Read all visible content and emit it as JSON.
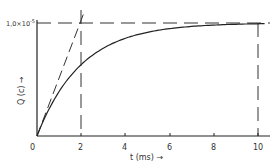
{
  "chart_data": {
    "type": "line",
    "title": "",
    "xlabel": "t (ms) →",
    "ylabel": "Q (c) →",
    "xlim": [
      0,
      11
    ],
    "ylim": [
      0,
      1e-05
    ],
    "x_ticks": [
      0,
      2,
      4,
      6,
      8,
      10
    ],
    "x_tick_labels": [
      "0",
      "2",
      "4",
      "6",
      "8",
      "10"
    ],
    "y_tick_labels": [
      "1.0×10⁻⁵"
    ],
    "grid": false,
    "legend": null,
    "series": [
      {
        "name": "Q(t) charging curve",
        "style": "solid",
        "x": [
          0,
          0.5,
          1,
          1.5,
          2,
          3,
          4,
          5,
          6,
          7,
          8,
          9,
          10
        ],
        "values": [
          0,
          2.2e-06,
          3.9e-06,
          5.3e-06,
          6.3e-06,
          7.8e-06,
          8.6e-06,
          9.2e-06,
          9.5e-06,
          9.7e-06,
          9.8e-06,
          9.9e-06,
          1e-05
        ]
      },
      {
        "name": "initial tangent",
        "style": "dashed",
        "x": [
          0,
          2.1
        ],
        "values": [
          0,
          1.05e-05
        ]
      }
    ],
    "annotations": [
      {
        "type": "hline",
        "style": "dashed",
        "y": 1e-05,
        "label": "1.0×10⁻⁵"
      },
      {
        "type": "vline",
        "style": "dashed",
        "x": 2
      },
      {
        "type": "vline",
        "style": "dashed",
        "x": 10
      }
    ]
  },
  "labels": {
    "y_value": "1,0×10",
    "y_exp": "-5",
    "x_axis": "t (ms) →",
    "y_axis": "Q (c) →",
    "ticks": [
      "0",
      "2",
      "4",
      "6",
      "8",
      "10"
    ]
  }
}
